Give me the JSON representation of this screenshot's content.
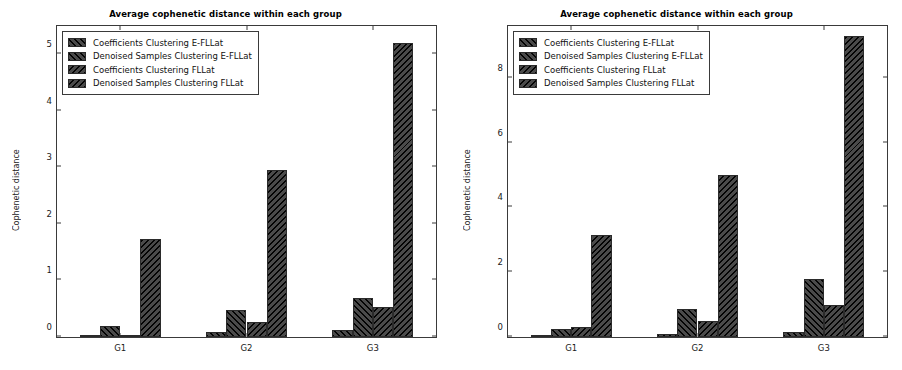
{
  "figure": {
    "background": "#ffffff",
    "bar_color": "#4a4a4a",
    "edge_color": "#2b2b2b"
  },
  "panels": [
    {
      "id": "left-panel",
      "title": "Average cophenetic distance within each group",
      "ylabel": "Cophenetic distance",
      "yticks": [
        "0",
        "1",
        "2",
        "3",
        "4",
        "5"
      ],
      "xticks": [
        "G1",
        "G2",
        "G3"
      ],
      "legend": [
        "Coefficients Clustering  E-FLLat",
        "Denoised Samples Clustering E-FLLat",
        "Coefficients Clustering FLLat",
        "Denoised Samples Clustering FLLat"
      ]
    },
    {
      "id": "right-panel",
      "title": "Average cophenetic distance within each group",
      "ylabel": "Cophenetic distance",
      "yticks": [
        "0",
        "2",
        "4",
        "6",
        "8"
      ],
      "xticks": [
        "G1",
        "G2",
        "G3"
      ],
      "legend": [
        "Coefficients Clustering  E-FLLat",
        "Denoised Samples Clustering E-FLLat",
        "Coefficients Clustering FLLat",
        "Denoised Samples Clustering FLLat"
      ]
    }
  ],
  "chart_data": [
    {
      "type": "bar",
      "title": "Average cophenetic distance within each group",
      "xlabel": "",
      "ylabel": "Cophenetic distance",
      "categories": [
        "G1",
        "G2",
        "G3"
      ],
      "ylim": [
        0,
        5.5
      ],
      "yticks": [
        0,
        1,
        2,
        3,
        4,
        5
      ],
      "grid": false,
      "legend_position": "upper left",
      "series": [
        {
          "name": "Coefficients Clustering  E-FLLat",
          "values": [
            0.02,
            0.08,
            0.12
          ]
        },
        {
          "name": "Denoised Samples Clustering E-FLLat",
          "values": [
            0.2,
            0.47,
            0.69
          ]
        },
        {
          "name": "Coefficients Clustering FLLat",
          "values": [
            0.02,
            0.27,
            0.53
          ]
        },
        {
          "name": "Denoised Samples Clustering FLLat",
          "values": [
            1.73,
            2.95,
            5.2
          ]
        }
      ]
    },
    {
      "type": "bar",
      "title": "Average cophenetic distance within each group",
      "xlabel": "",
      "ylabel": "Cophenetic distance",
      "categories": [
        "G1",
        "G2",
        "G3"
      ],
      "ylim": [
        0,
        9.6
      ],
      "yticks": [
        0,
        2,
        4,
        6,
        8
      ],
      "grid": false,
      "legend_position": "upper left",
      "series": [
        {
          "name": "Coefficients Clustering  E-FLLat",
          "values": [
            0.05,
            0.08,
            0.17
          ]
        },
        {
          "name": "Denoised Samples Clustering E-FLLat",
          "values": [
            0.25,
            0.87,
            1.78
          ]
        },
        {
          "name": "Coefficients Clustering FLLat",
          "values": [
            0.3,
            0.5,
            1.0
          ]
        },
        {
          "name": "Denoised Samples Clustering FLLat",
          "values": [
            3.15,
            5.0,
            9.3
          ]
        }
      ]
    }
  ]
}
